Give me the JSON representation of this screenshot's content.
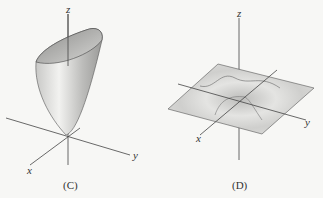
{
  "figures": [
    {
      "id": "C",
      "caption": "(C)",
      "axes": {
        "x": "x",
        "y": "y",
        "z": "z"
      },
      "surface": "paraboloid"
    },
    {
      "id": "D",
      "caption": "(D)",
      "axes": {
        "x": "x",
        "y": "y",
        "z": "z"
      },
      "surface": "wave"
    }
  ]
}
